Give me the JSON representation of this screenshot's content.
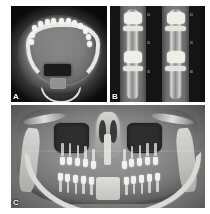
{
  "figure": {
    "background_color": "#ffffff",
    "width": 210,
    "height": 214,
    "modality": "CBCT / dental maxillofacial radiograph",
    "panel_count": 3
  },
  "panels": {
    "a": {
      "label": "A",
      "view": "axial slice",
      "anatomy": "mandibular arch with dentition, oropharyngeal airway, cervical vertebra",
      "bone_color": "#e8e8e4",
      "soft_tissue_color": "#7c7c7c",
      "air_color": "#1b1b1b",
      "teeth": [
        {
          "left": 22,
          "top": 20
        },
        {
          "left": 28,
          "top": 16
        },
        {
          "left": 35,
          "top": 14
        },
        {
          "left": 42,
          "top": 13
        },
        {
          "left": 50,
          "top": 13
        },
        {
          "left": 57,
          "top": 13
        },
        {
          "left": 64,
          "top": 15
        },
        {
          "left": 70,
          "top": 18
        },
        {
          "left": 75,
          "top": 23
        },
        {
          "left": 20,
          "top": 27
        },
        {
          "left": 78,
          "top": 29
        },
        {
          "left": 19,
          "top": 34
        },
        {
          "left": 79,
          "top": 36
        }
      ]
    },
    "b": {
      "label": "B",
      "view": "cross-sectional slices",
      "anatomy": "paired buccolingual cross-sections through alveolar ridge",
      "slice_count": 2,
      "background_color": "#111111",
      "slices": [
        {
          "left": 10,
          "width": 28,
          "tick_labels": [
            "10",
            "20",
            "30"
          ]
        },
        {
          "left": 55,
          "width": 28,
          "tick_labels": [
            "10",
            "20",
            "30"
          ]
        }
      ],
      "dark_strips": [
        {
          "left": 0,
          "width": 10
        },
        {
          "left": 38,
          "width": 17
        },
        {
          "left": 83,
          "width": 12
        }
      ]
    },
    "c": {
      "label": "C",
      "view": "coronal / panoramic reconstruction",
      "anatomy": "maxillary sinuses, nasal cavity and septum, maxillary and mandibular dentition, mandibular rami",
      "sinus_color": "#2d2d2d",
      "bone_color": "#dadad6",
      "soft_tissue_color": "#8a8a8a",
      "upper_teeth": [
        {
          "left": 25,
          "top": 50,
          "height": 8,
          "root": 13
        },
        {
          "left": 29,
          "top": 50,
          "height": 8,
          "root": 13
        },
        {
          "left": 33,
          "top": 51,
          "height": 8,
          "root": 12
        },
        {
          "left": 37,
          "top": 52,
          "height": 8,
          "root": 12
        },
        {
          "left": 41,
          "top": 54,
          "height": 8,
          "root": 11
        },
        {
          "left": 57,
          "top": 54,
          "height": 8,
          "root": 11
        },
        {
          "left": 61,
          "top": 52,
          "height": 8,
          "root": 12
        },
        {
          "left": 65,
          "top": 51,
          "height": 8,
          "root": 12
        },
        {
          "left": 69,
          "top": 50,
          "height": 8,
          "root": 13
        },
        {
          "left": 73,
          "top": 50,
          "height": 8,
          "root": 13
        }
      ],
      "lower_teeth": [
        {
          "left": 24,
          "top": 66,
          "height": 8,
          "root": 10
        },
        {
          "left": 28,
          "top": 67,
          "height": 8,
          "root": 10
        },
        {
          "left": 32,
          "top": 68,
          "height": 8,
          "root": 10
        },
        {
          "left": 36,
          "top": 69,
          "height": 8,
          "root": 9
        },
        {
          "left": 40,
          "top": 70,
          "height": 8,
          "root": 9
        },
        {
          "left": 58,
          "top": 70,
          "height": 8,
          "root": 9
        },
        {
          "left": 62,
          "top": 69,
          "height": 8,
          "root": 9
        },
        {
          "left": 66,
          "top": 68,
          "height": 8,
          "root": 10
        },
        {
          "left": 70,
          "top": 67,
          "height": 8,
          "root": 10
        },
        {
          "left": 74,
          "top": 66,
          "height": 8,
          "root": 10
        }
      ]
    }
  }
}
